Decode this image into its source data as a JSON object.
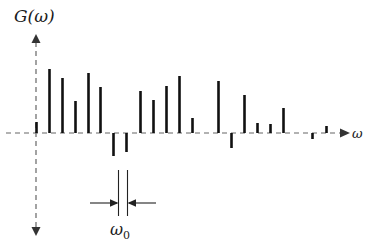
{
  "figure": {
    "title": "",
    "y_axis_label": "G(ω)",
    "x_axis_label": "ω",
    "spacing_annotation_label": "ω",
    "spacing_annotation_subscript": "0",
    "colors": {
      "stem": "#111111",
      "axis": "#555555",
      "background": "#ffffff",
      "annotation": "#1a1a1a"
    }
  },
  "chart_data": {
    "type": "bar",
    "title": "G(ω)",
    "xlabel": "ω",
    "ylabel": "G(ω)",
    "grid": false,
    "legend": null,
    "axis_ranges": {
      "x_pixels": [
        36,
        345
      ],
      "y_baseline_pixel": 133,
      "y_top_pixel": 38,
      "y_bottom_pixel": 233
    },
    "x": [
      0,
      1,
      2,
      3,
      4,
      5,
      6,
      7,
      8,
      9,
      10,
      11,
      12,
      13,
      14,
      15,
      16,
      17,
      18,
      19,
      20,
      21,
      22,
      23
    ],
    "x_pixels": [
      36,
      49,
      62,
      75,
      88,
      100,
      113,
      126,
      140,
      153,
      166,
      179,
      192,
      205,
      218,
      231,
      244,
      257,
      270,
      283,
      298,
      312,
      326,
      339
    ],
    "values": [
      11,
      64,
      55,
      32,
      60,
      46,
      -23,
      -19,
      42,
      33,
      47,
      57,
      15,
      0,
      52,
      -15,
      38,
      10,
      9,
      25,
      0,
      -6,
      7,
      0
    ],
    "categories": [
      "0",
      "ω₀",
      "2ω₀",
      "3ω₀",
      "4ω₀",
      "5ω₀",
      "6ω₀",
      "7ω₀",
      "8ω₀",
      "9ω₀",
      "10ω₀",
      "11ω₀",
      "12ω₀",
      "13ω₀",
      "14ω₀",
      "15ω₀",
      "16ω₀",
      "17ω₀",
      "18ω₀",
      "19ω₀",
      "20ω₀",
      "21ω₀",
      "22ω₀",
      "23ω₀"
    ],
    "ylim": [
      -30,
      95
    ],
    "annotations": [
      {
        "name": "omega0-spacing",
        "text": "ω₀",
        "from_x_pixel": 118,
        "to_x_pixel": 127,
        "y_pixel": 203,
        "style": "double-headed inward arrow between two vertical tick lines"
      }
    ]
  }
}
